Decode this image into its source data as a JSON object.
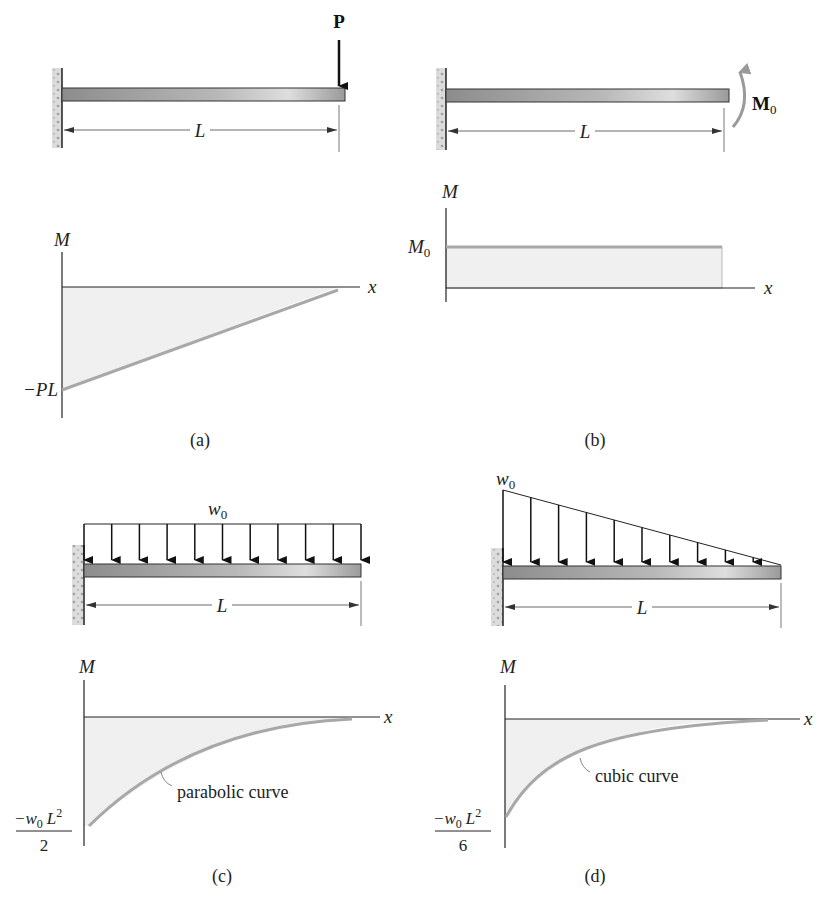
{
  "figure": {
    "panels": [
      {
        "id": "a",
        "caption": "(a)",
        "loading": "point load at free end",
        "load_label": "P",
        "span_label": "L",
        "diagram": {
          "y_axis_label": "M",
          "x_axis_label": "x",
          "value_label": "−PL",
          "curve_type": "linear"
        }
      },
      {
        "id": "b",
        "caption": "(b)",
        "loading": "couple moment at free end",
        "load_label": "M",
        "load_subscript": "0",
        "span_label": "L",
        "diagram": {
          "y_axis_label": "M",
          "x_axis_label": "x",
          "value_label": "M",
          "value_subscript": "0",
          "curve_type": "constant"
        }
      },
      {
        "id": "c",
        "caption": "(c)",
        "loading": "uniform distributed load",
        "load_label": "w",
        "load_subscript": "0",
        "span_label": "L",
        "diagram": {
          "y_axis_label": "M",
          "x_axis_label": "x",
          "value_numerator": "−w",
          "value_num_sub": "0",
          "value_num_L": "L",
          "value_num_exp": "2",
          "value_denominator": "2",
          "curve_label": "parabolic curve",
          "curve_type": "parabolic"
        }
      },
      {
        "id": "d",
        "caption": "(d)",
        "loading": "triangular distributed load",
        "load_label": "w",
        "load_subscript": "0",
        "span_label": "L",
        "diagram": {
          "y_axis_label": "M",
          "x_axis_label": "x",
          "value_numerator": "−w",
          "value_num_sub": "0",
          "value_num_L": "L",
          "value_num_exp": "2",
          "value_denominator": "6",
          "curve_label": "cubic curve",
          "curve_type": "cubic"
        }
      }
    ]
  },
  "colors": {
    "line": "#222222",
    "curve": "#a8a8a8",
    "fill": "#efefef",
    "beam_dark": "#8a8a8a",
    "beam_light": "#d8d8d8",
    "wall": "#d4d4d4"
  }
}
